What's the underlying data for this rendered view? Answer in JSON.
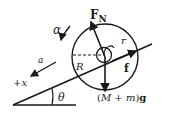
{
  "diagram": {
    "title": "",
    "labels": {
      "normal_force": "F",
      "normal_force_sub": "N",
      "angular_accel": "α",
      "radius_small": "r",
      "radius_large": "R",
      "friction": "f",
      "weight_prefix": "(",
      "weight_M": "M",
      "weight_plus": " + ",
      "weight_m": "m",
      "weight_suffix": ")",
      "weight_g": "g",
      "accel": "a",
      "positive_x": "+x",
      "angle": "θ"
    },
    "colors": {
      "ink": "#1a1a1a",
      "background": "#ffffff"
    }
  }
}
